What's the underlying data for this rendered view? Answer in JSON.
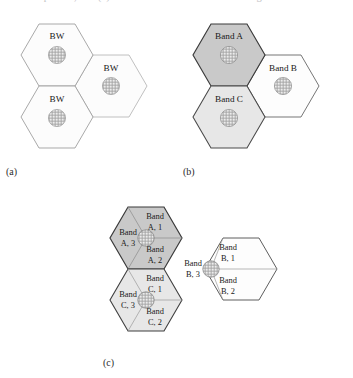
{
  "caption": {
    "partial_top_line": "reuse pattern, and (c) a sectored three-band reuse arrangement"
  },
  "colors": {
    "band_a_fill": "#c9c9c9",
    "band_b_fill": "#fdfdfd",
    "band_c_fill": "#e7e7e7",
    "bw_fill": "#fcfcfc",
    "outline_dark": "#2e2e2e",
    "outline_light": "#b4b4b4",
    "sector_line": "#9a9a9a",
    "hatch_circle_fill": "#e0e0e0",
    "hatch_stroke": "#8e8e8e"
  },
  "panels": [
    {
      "id": "a",
      "label": "(a)",
      "cells": [
        {
          "name": "bw-cell-top-left",
          "label": "BW",
          "fill": "bw_fill",
          "cx": 57,
          "cy": 55
        },
        {
          "name": "bw-cell-bottom-left",
          "label": "BW",
          "fill": "bw_fill",
          "cx": 57,
          "cy": 117
        },
        {
          "name": "bw-cell-right",
          "label": "BW",
          "fill": "bw_fill",
          "cx": 111,
          "cy": 86
        }
      ]
    },
    {
      "id": "b",
      "label": "(b)",
      "cells": [
        {
          "name": "band-a-cell",
          "label": "Band A",
          "fill": "band_a_fill",
          "cx": 229,
          "cy": 55
        },
        {
          "name": "band-c-cell",
          "label": "Band C",
          "fill": "band_c_fill",
          "cx": 229,
          "cy": 117
        },
        {
          "name": "band-b-cell",
          "label": "Band B",
          "fill": "band_b_fill",
          "cx": 283,
          "cy": 86
        }
      ]
    },
    {
      "id": "c",
      "label": "(c)",
      "cells": [
        {
          "name": "sectored-band-a-cell",
          "fill": "band_a_fill",
          "cx": 146,
          "cy": 238,
          "sectors": [
            {
              "name": "sector-a-1",
              "line1": "Band",
              "line2": "A, 1",
              "pos": "top"
            },
            {
              "name": "sector-a-2",
              "line1": "Band",
              "line2": "A, 2",
              "pos": "bottom"
            },
            {
              "name": "sector-a-3",
              "line1": "Band",
              "line2": "A, 3",
              "pos": "left"
            }
          ]
        },
        {
          "name": "sectored-band-c-cell",
          "fill": "band_c_fill",
          "cx": 146,
          "cy": 300,
          "sectors": [
            {
              "name": "sector-c-1",
              "line1": "Band",
              "line2": "C, 1",
              "pos": "top"
            },
            {
              "name": "sector-c-2",
              "line1": "Band",
              "line2": "C, 2",
              "pos": "bottom"
            },
            {
              "name": "sector-c-3",
              "line1": "Band",
              "line2": "C, 3",
              "pos": "left"
            }
          ]
        },
        {
          "name": "sectored-band-b-cell",
          "fill": "band_b_fill",
          "cx": 211,
          "cy": 269,
          "sectors": [
            {
              "name": "sector-b-1",
              "line1": "Band",
              "line2": "B, 1",
              "pos": "top"
            },
            {
              "name": "sector-b-2",
              "line1": "Band",
              "line2": "B, 2",
              "pos": "bottom"
            },
            {
              "name": "sector-b-3",
              "line1": "Band",
              "line2": "B, 3",
              "pos": "left"
            }
          ]
        }
      ]
    }
  ],
  "labels": {
    "bw": "BW",
    "band_a": "Band A",
    "band_b": "Band B",
    "band_c": "Band C",
    "band_word": "Band",
    "a1": "A, 1",
    "a2": "A, 2",
    "a3": "A, 3",
    "b1": "B, 1",
    "b2": "B, 2",
    "b3": "B, 3",
    "c1": "C, 1",
    "c2": "C, 2",
    "c3": "C, 3",
    "panel_a": "(a)",
    "panel_b": "(b)",
    "panel_c": "(c)"
  }
}
